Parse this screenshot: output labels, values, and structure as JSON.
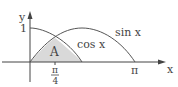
{
  "diagram": {
    "axes": {
      "x_label": "x",
      "y_label": "y",
      "y_tick_label": "1",
      "x_tick_pi": "π",
      "x_tick_pi4_num": "π",
      "x_tick_pi4_den": "4"
    },
    "curves": [
      {
        "name": "sin",
        "label": "sin x"
      },
      {
        "name": "cos",
        "label": "cos x"
      }
    ],
    "region": {
      "label": "A",
      "fill": "#d9d9d9"
    },
    "colors": {
      "line": "#555555",
      "axis": "#444444",
      "text": "#444444"
    }
  }
}
